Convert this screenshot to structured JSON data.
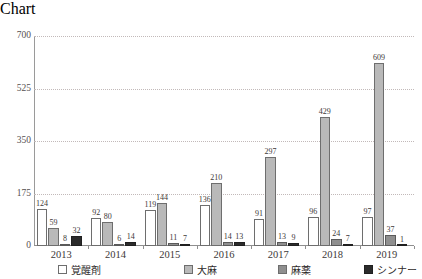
{
  "chart_data": {
    "type": "bar",
    "title": "",
    "subtitle": "",
    "xlabel": "",
    "ylabel": "",
    "ylim": [
      0,
      700
    ],
    "yticks": [
      0,
      175,
      350,
      525,
      700
    ],
    "grid": true,
    "legend_position": "bottom",
    "categories": [
      "2013",
      "2014",
      "2015",
      "2016",
      "2017",
      "2018",
      "2019"
    ],
    "series": [
      {
        "name": "覚醒剤",
        "color": "#ffffff",
        "values": [
          124,
          92,
          119,
          136,
          91,
          96,
          97
        ]
      },
      {
        "name": "大麻",
        "color": "#b9b9b9",
        "values": [
          59,
          80,
          144,
          210,
          297,
          429,
          609
        ]
      },
      {
        "name": "麻薬",
        "color": "#8f8f8f",
        "values": [
          8,
          6,
          11,
          14,
          13,
          24,
          37
        ]
      },
      {
        "name": "シンナー",
        "color": "#2b2b2b",
        "values": [
          32,
          14,
          7,
          13,
          9,
          7,
          1
        ]
      }
    ]
  }
}
